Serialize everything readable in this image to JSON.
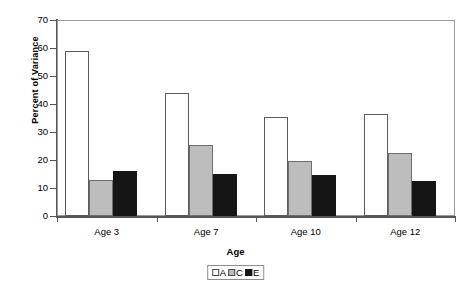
{
  "figure": {
    "cropped_top_text": "",
    "background": "#ffffff"
  },
  "chart_data": {
    "type": "bar",
    "title": "",
    "xlabel": "Age",
    "ylabel": "Percent of Variance",
    "categories": [
      "Age 3",
      "Age 7",
      "Age 10",
      "Age 12"
    ],
    "series": [
      {
        "name": "A",
        "color": "#ffffff",
        "values": [
          59,
          44,
          35.5,
          36.5
        ]
      },
      {
        "name": "C",
        "color": "#bdbdbd",
        "values": [
          13,
          25.5,
          19.5,
          22.5
        ]
      },
      {
        "name": "E",
        "color": "#151515",
        "values": [
          16,
          15,
          14.5,
          12.5
        ]
      }
    ],
    "ylim": [
      0,
      70
    ],
    "yticks": [
      0,
      10,
      20,
      30,
      40,
      50,
      60,
      70
    ],
    "ytick_labels": [
      "0",
      "10",
      "20",
      "30",
      "40",
      "50",
      "60",
      "70"
    ],
    "grid": false,
    "legend_position": "bottom-center",
    "legend_entries": [
      "A",
      "C",
      "E"
    ]
  }
}
